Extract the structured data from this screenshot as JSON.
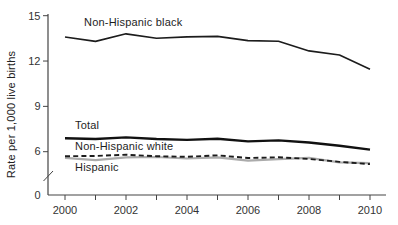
{
  "chart_data": {
    "type": "line",
    "title": "",
    "ylabel": "Rate per 1,000 live births",
    "xlabel": "",
    "x": [
      2000,
      2001,
      2002,
      2003,
      2004,
      2005,
      2006,
      2007,
      2008,
      2009,
      2010
    ],
    "x_tick_years": [
      2000,
      2001,
      2002,
      2003,
      2004,
      2005,
      2006,
      2007,
      2008,
      2009,
      2010
    ],
    "x_label_years": [
      2000,
      2002,
      2004,
      2006,
      2008,
      2010
    ],
    "y_ticks": [
      0,
      6,
      9,
      12,
      15
    ],
    "ylim": [
      0,
      15
    ],
    "y_axis_break_between": [
      0,
      5
    ],
    "grid": false,
    "legend": "inline-labels",
    "axis_color": "#444444",
    "series": [
      {
        "name": "Non-Hispanic black",
        "line_style": "solid",
        "color": "#1c1c1c",
        "stroke_width": 1.6,
        "values": [
          13.59,
          13.3,
          13.8,
          13.51,
          13.6,
          13.63,
          13.35,
          13.31,
          12.67,
          12.4,
          11.46
        ]
      },
      {
        "name": "Total",
        "line_style": "solid",
        "color": "#111111",
        "stroke_width": 2.4,
        "values": [
          6.89,
          6.84,
          6.95,
          6.84,
          6.78,
          6.86,
          6.68,
          6.75,
          6.61,
          6.39,
          6.14
        ]
      },
      {
        "name": "Non-Hispanic white",
        "line_style": "dashed",
        "color": "#1c1c1c",
        "stroke_width": 1.9,
        "values": [
          5.7,
          5.72,
          5.8,
          5.7,
          5.66,
          5.76,
          5.58,
          5.63,
          5.52,
          5.33,
          5.18
        ]
      },
      {
        "name": "Hispanic",
        "line_style": "solid",
        "color": "#ababab",
        "stroke_width": 2.2,
        "values": [
          5.59,
          5.44,
          5.62,
          5.65,
          5.55,
          5.62,
          5.41,
          5.51,
          5.59,
          5.29,
          5.25
        ]
      }
    ]
  }
}
